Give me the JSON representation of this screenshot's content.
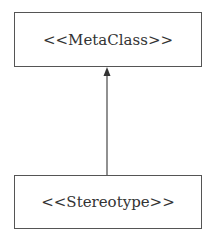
{
  "diagram": {
    "nodes": [
      {
        "id": "metaclass",
        "label": "<<MetaClass>>"
      },
      {
        "id": "stereotype",
        "label": "<<Stereotype>>"
      }
    ],
    "edges": [
      {
        "from": "stereotype",
        "to": "metaclass",
        "type": "association-arrow",
        "arrowhead": "filled-triangle"
      }
    ],
    "colors": {
      "stroke": "#555555",
      "text": "#333333",
      "background": "#ffffff"
    }
  }
}
